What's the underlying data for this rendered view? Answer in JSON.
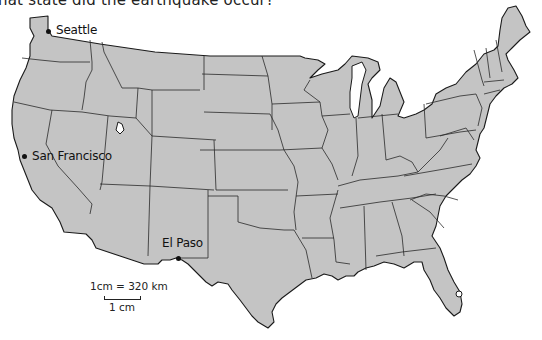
{
  "question": {
    "text": "hat state did the earthquake occur?"
  },
  "map": {
    "title": "United States map",
    "land_color": "#c4c4c4",
    "water_color": "#ffffff",
    "border_color": "#1a1a1a",
    "cities": [
      {
        "name": "Seattle",
        "x": 52,
        "y": 34
      },
      {
        "name": "San Francisco",
        "x": 22,
        "y": 156
      },
      {
        "name": "El Paso",
        "x": 178,
        "y": 257
      }
    ]
  },
  "scale": {
    "ratio_label": "1cm = 320 km",
    "bar_label": "1 cm"
  }
}
